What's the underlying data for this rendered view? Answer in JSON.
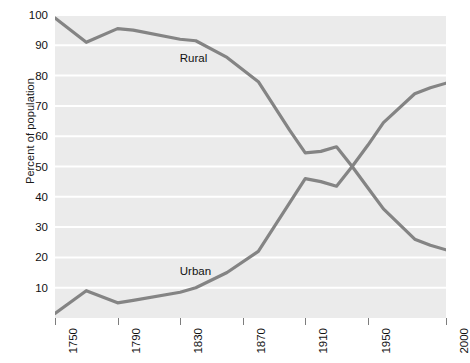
{
  "chart_data": {
    "type": "line",
    "title": "",
    "subtitle": "",
    "xlabel": "",
    "ylabel": "Percent of population",
    "xlim": [
      1750,
      2000
    ],
    "ylim": [
      0,
      100
    ],
    "grid": true,
    "legend_position": "inline-annotations",
    "xticks": [
      1750,
      1790,
      1830,
      1870,
      1910,
      1950,
      2000
    ],
    "xtick_labels": [
      "1750",
      "1790",
      "1830",
      "1870",
      "1910",
      "1950",
      "2000"
    ],
    "yticks": [
      10,
      20,
      30,
      40,
      50,
      60,
      70,
      80,
      90,
      100
    ],
    "ytick_labels": [
      "10",
      "20",
      "30",
      "40",
      "50",
      "60",
      "70",
      "80",
      "90",
      "100"
    ],
    "annotations": [
      {
        "text": "Rural",
        "x": 1840,
        "y": 85
      },
      {
        "text": "Urban",
        "x": 1840,
        "y": 15
      }
    ],
    "series": [
      {
        "name": "Rural",
        "color": "#848484",
        "x": [
          1750,
          1770,
          1790,
          1800,
          1830,
          1840,
          1860,
          1880,
          1900,
          1910,
          1920,
          1930,
          1940,
          1950,
          1960,
          1980,
          1990,
          2000
        ],
        "values": [
          99,
          91,
          95.5,
          95,
          92,
          91.5,
          86,
          78,
          62,
          54.5,
          55,
          56.5,
          50,
          43,
          36,
          26,
          24,
          22.5
        ]
      },
      {
        "name": "Urban",
        "color": "#848484",
        "x": [
          1750,
          1770,
          1790,
          1800,
          1830,
          1840,
          1860,
          1880,
          1900,
          1910,
          1920,
          1930,
          1940,
          1950,
          1960,
          1980,
          1990,
          2000
        ],
        "values": [
          1.5,
          9,
          5,
          5.8,
          8.5,
          10,
          15,
          22,
          38,
          46,
          45,
          43.5,
          50,
          57,
          64.5,
          74,
          76,
          77.5
        ]
      }
    ]
  },
  "colors": {
    "panel_background": "#ebebeb",
    "gridline": "#ffffff",
    "line": "#848484",
    "text": "#111111",
    "page_background": "#ffffff"
  }
}
